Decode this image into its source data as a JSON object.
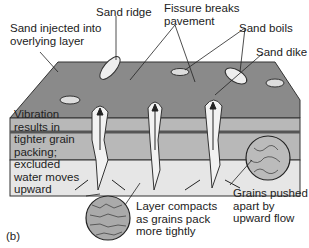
{
  "figure": {
    "panel_label": "(b)",
    "labels": {
      "sand_injected": [
        "Sand injected into",
        "overlying layer"
      ],
      "sand_ridge": "Sand ridge",
      "fissure": [
        "Fissure breaks",
        "pavement"
      ],
      "sand_boils": "Sand boils",
      "sand_dike": "Sand dike",
      "vibration": [
        "Vibration",
        "results in",
        "tighter grain",
        "packing;",
        "excluded",
        "water moves",
        "upward"
      ],
      "layer_compacts": [
        "Layer compacts",
        "as grains pack",
        "more tightly"
      ],
      "grains_pushed": [
        "Grains pushed",
        "apart by",
        "upward flow"
      ]
    },
    "colors": {
      "surface": "#8a8a8a",
      "upper_layer": "#b8b8b8",
      "lower_layer": "#e6e6e6",
      "sand": "#f2f2f2",
      "outline": "#333333"
    }
  }
}
